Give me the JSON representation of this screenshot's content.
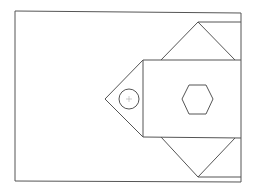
{
  "diagram": {
    "type": "line-drawing",
    "stroke_color": "#555555",
    "background": "#ffffff",
    "shapes": [
      {
        "name": "outer-frame",
        "kind": "rect"
      },
      {
        "name": "center-rect",
        "kind": "rect"
      },
      {
        "name": "top-triangle",
        "kind": "triangle"
      },
      {
        "name": "bottom-triangle",
        "kind": "triangle"
      },
      {
        "name": "left-triangle",
        "kind": "triangle"
      },
      {
        "name": "circle-marker",
        "kind": "circle"
      },
      {
        "name": "hexagon",
        "kind": "hexagon"
      }
    ]
  }
}
